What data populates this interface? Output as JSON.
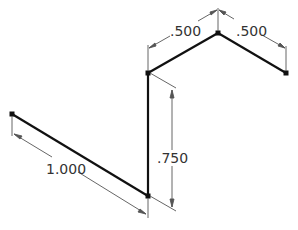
{
  "diagram": {
    "colors": {
      "geometry": "#111111",
      "dimension": "#555555",
      "text": "#333333"
    },
    "points": [
      {
        "id": "P1",
        "x": 12,
        "y": 114
      },
      {
        "id": "P2",
        "x": 148,
        "y": 196
      },
      {
        "id": "P3",
        "x": 148,
        "y": 73
      },
      {
        "id": "P4",
        "x": 218,
        "y": 33
      },
      {
        "id": "P5",
        "x": 286,
        "y": 73
      }
    ],
    "dimensions": [
      {
        "id": "dim-1000",
        "label": "1.000"
      },
      {
        "id": "dim-750",
        "label": ".750"
      },
      {
        "id": "dim-500-left",
        "label": ".500"
      },
      {
        "id": "dim-500-right",
        "label": ".500"
      }
    ]
  }
}
